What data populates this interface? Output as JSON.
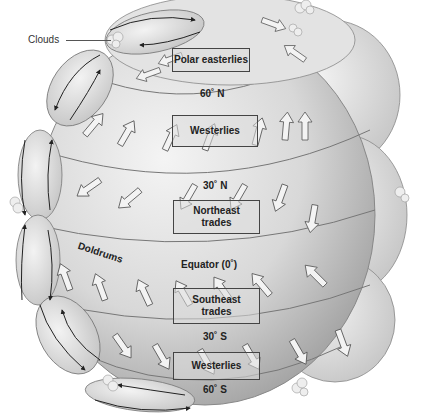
{
  "diagram": {
    "callouts": {
      "clouds": "Clouds"
    },
    "wind_belts": [
      {
        "id": "polar-easterlies-north",
        "label": "Polar easterlies"
      },
      {
        "id": "westerlies-north",
        "label": "Westerlies"
      },
      {
        "id": "northeast-trades",
        "label": "Northeast trades",
        "line1": "Northeast",
        "line2": "trades"
      },
      {
        "id": "southeast-trades",
        "label": "Southeast trades",
        "line1": "Southeast",
        "line2": "trades"
      },
      {
        "id": "westerlies-south",
        "label": "Westerlies"
      }
    ],
    "latitudes": [
      {
        "id": "lat-60n",
        "label": "60˚ N"
      },
      {
        "id": "lat-30n",
        "label": "30˚ N"
      },
      {
        "id": "lat-equator",
        "label": "Equator (0˚)"
      },
      {
        "id": "lat-30s",
        "label": "30˚ S"
      },
      {
        "id": "lat-60s",
        "label": "60˚ S"
      }
    ],
    "zones": {
      "doldrums": "Doldrums"
    },
    "colors": {
      "globe": "#d9d9d9",
      "globe_shadow": "#a8a8a8",
      "cell": "#e6e6e6",
      "arrow_fill": "#f2f2f2",
      "arrow_stroke": "#555555",
      "text": "#222222"
    }
  }
}
